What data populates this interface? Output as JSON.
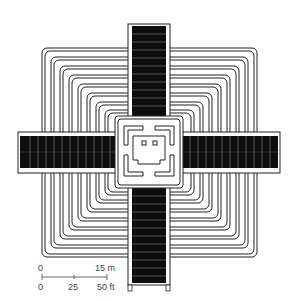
{
  "diagram": {
    "type": "architectural-plan",
    "colors": {
      "line": "#222222",
      "fill_dark": "#0d0d0d",
      "background": "#ffffff"
    },
    "terrace_count": 9
  },
  "scale_bar": {
    "metric_start": "0",
    "metric_end": "15 m",
    "imperial_start": "0",
    "imperial_mid": "25",
    "imperial_end": "50 ft"
  }
}
